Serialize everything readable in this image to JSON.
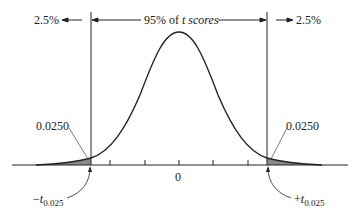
{
  "diagram": {
    "left_tail_pct": "2.5%",
    "right_tail_pct": "2.5%",
    "center_label_prefix": "95% of ",
    "center_label_italic": "t scores",
    "left_area": "0.0250",
    "right_area": "0.0250",
    "center_tick": "0",
    "left_crit_sign": "−",
    "right_crit_sign": "+",
    "crit_var": "t",
    "crit_sub": "0.025"
  },
  "colors": {
    "line": "#222222",
    "shade": "#8a8a8a"
  }
}
